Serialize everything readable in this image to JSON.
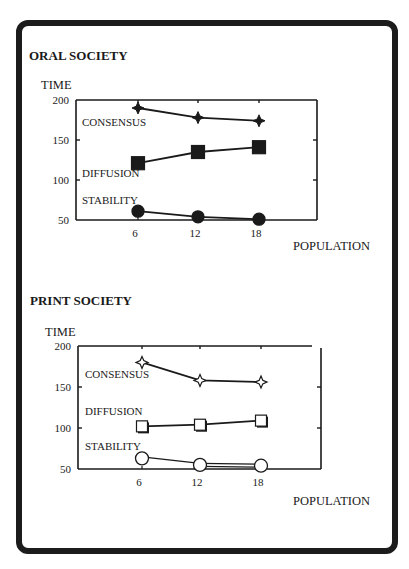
{
  "chart_data": [
    {
      "type": "line",
      "title": "ORAL SOCIETY",
      "ylabel": "TIME",
      "xlabel": "POPULATION",
      "x": [
        6,
        12,
        18
      ],
      "x_tick_labels": [
        "6",
        "12",
        "18"
      ],
      "y_ticks": [
        200,
        150,
        100,
        50
      ],
      "y_tick_labels": [
        "200",
        "150",
        "100",
        "50"
      ],
      "ylim": [
        50,
        200
      ],
      "grid": false,
      "series": [
        {
          "name": "CONSENSUS",
          "marker": "filled-star",
          "values": [
            190,
            178,
            174
          ]
        },
        {
          "name": "DIFFUSION",
          "marker": "filled-square",
          "values": [
            121,
            135,
            141
          ]
        },
        {
          "name": "STABILITY",
          "marker": "filled-circle",
          "values": [
            61,
            54,
            51
          ]
        }
      ]
    },
    {
      "type": "line",
      "title": "PRINT SOCIETY",
      "ylabel": "TIME",
      "xlabel": "POPULATION",
      "x": [
        6,
        12,
        18
      ],
      "x_tick_labels": [
        "6",
        "12",
        "18"
      ],
      "y_ticks": [
        200,
        150,
        100,
        50
      ],
      "y_tick_labels": [
        "200",
        "150",
        "100",
        "50"
      ],
      "ylim": [
        50,
        200
      ],
      "grid": false,
      "series": [
        {
          "name": "CONSENSUS",
          "marker": "open-star",
          "values": [
            180,
            158,
            156
          ]
        },
        {
          "name": "DIFFUSION",
          "marker": "open-square",
          "values": [
            102,
            104,
            109
          ]
        },
        {
          "name": "STABILITY",
          "marker": "open-circle",
          "values": [
            63,
            55,
            54
          ]
        }
      ]
    }
  ],
  "colors": {
    "ink": "#1a1a1a",
    "paper": "#ffffff"
  }
}
